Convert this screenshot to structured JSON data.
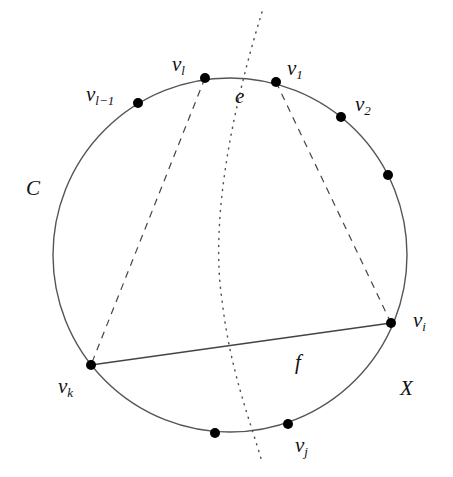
{
  "figure": {
    "circle_label": "C",
    "outer_region_label": "X",
    "face_label": "f",
    "edge_label": "e",
    "colors": {
      "stroke": "#555555",
      "vertex": "#000000",
      "text": "#111111",
      "background": "#ffffff"
    }
  },
  "vertices": [
    {
      "id": "v_l_minus_1",
      "base": "v",
      "sub": "l−1",
      "x": 138,
      "y": 103
    },
    {
      "id": "v_l",
      "base": "v",
      "sub": "l",
      "x": 205,
      "y": 78
    },
    {
      "id": "v_1",
      "base": "v",
      "sub": "1",
      "x": 276,
      "y": 82
    },
    {
      "id": "v_2",
      "base": "v",
      "sub": "2",
      "x": 341,
      "y": 117
    },
    {
      "id": "unlabeled_right",
      "base": "",
      "sub": "",
      "x": 388,
      "y": 175
    },
    {
      "id": "v_i",
      "base": "v",
      "sub": "i",
      "x": 391,
      "y": 323
    },
    {
      "id": "v_j",
      "base": "v",
      "sub": "j",
      "x": 288,
      "y": 424
    },
    {
      "id": "unlabeled_bottom",
      "base": "",
      "sub": "",
      "x": 215,
      "y": 433
    },
    {
      "id": "v_k",
      "base": "v",
      "sub": "k",
      "x": 91,
      "y": 365
    }
  ],
  "edges": [
    {
      "from": "v_k",
      "to": "v_i",
      "style": "solid"
    },
    {
      "from": "v_l",
      "to": "v_k",
      "style": "dashed"
    },
    {
      "from": "v_1",
      "to": "v_i",
      "style": "dashed"
    },
    {
      "name": "dual-curve",
      "style": "dotted"
    }
  ]
}
